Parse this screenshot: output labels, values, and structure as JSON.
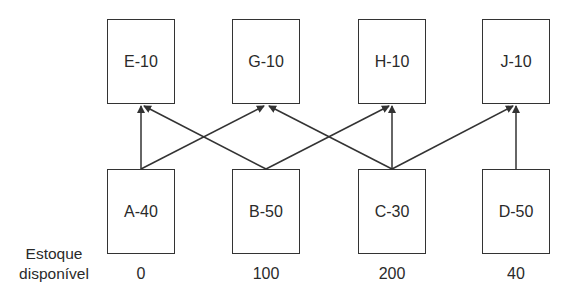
{
  "diagram": {
    "type": "bill-of-materials network",
    "top_row": [
      {
        "id": "E",
        "label": "E-10"
      },
      {
        "id": "G",
        "label": "G-10"
      },
      {
        "id": "H",
        "label": "H-10"
      },
      {
        "id": "J",
        "label": "J-10"
      }
    ],
    "bottom_row": [
      {
        "id": "A",
        "label": "A-40",
        "stock": "0"
      },
      {
        "id": "B",
        "label": "B-50",
        "stock": "100"
      },
      {
        "id": "C",
        "label": "C-30",
        "stock": "200"
      },
      {
        "id": "D",
        "label": "D-50",
        "stock": "40"
      }
    ],
    "edges": [
      {
        "from": "A",
        "to": "E"
      },
      {
        "from": "A",
        "to": "G"
      },
      {
        "from": "B",
        "to": "E"
      },
      {
        "from": "B",
        "to": "H"
      },
      {
        "from": "C",
        "to": "G"
      },
      {
        "from": "C",
        "to": "H"
      },
      {
        "from": "C",
        "to": "J"
      },
      {
        "from": "D",
        "to": "J"
      }
    ],
    "row_label": {
      "line1": "Estoque",
      "line2": "disponível"
    },
    "colors": {
      "line": "#333333",
      "text": "#2a2a2a",
      "background": "#ffffff"
    }
  }
}
